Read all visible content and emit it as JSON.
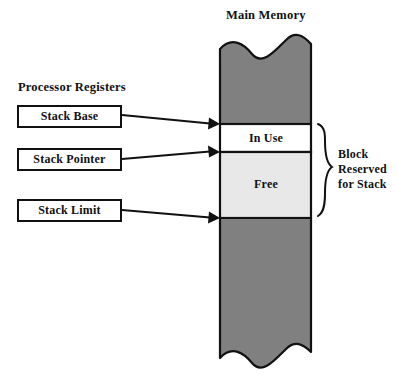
{
  "diagram": {
    "title_main_memory": "Main Memory",
    "title_processor_registers": "Processor Registers",
    "registers": [
      {
        "label": "Stack Base"
      },
      {
        "label": "Stack Pointer"
      },
      {
        "label": "Stack Limit"
      }
    ],
    "memory_sections": [
      {
        "label": "",
        "fill": "#808080",
        "kind": "other-memory-top"
      },
      {
        "label": "In Use",
        "fill": "#ffffff",
        "kind": "in-use"
      },
      {
        "label": "Free",
        "fill": "#e8e8e8",
        "kind": "free"
      },
      {
        "label": "",
        "fill": "#808080",
        "kind": "other-memory-bottom"
      }
    ],
    "brace_label_lines": [
      "Block",
      "Reserved",
      "for Stack"
    ],
    "colors": {
      "stroke": "#111111",
      "dark_memory": "#808080",
      "free_memory": "#e8e8e8",
      "in_use_memory": "#ffffff",
      "page_background": "#ffffff"
    }
  }
}
